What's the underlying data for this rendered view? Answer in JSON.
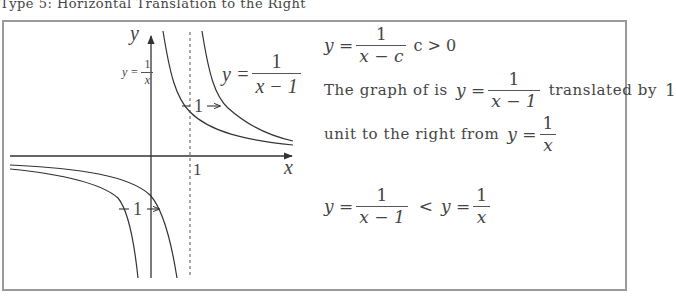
{
  "caption": "Type 5: Horizontal Translation to the Right",
  "graph": {
    "axis_x_label": "x",
    "axis_y_label": "y",
    "tick_label_1": "1",
    "curve_label_left": {
      "lhs": "y =",
      "num": "1",
      "den": "x"
    },
    "curve_label_right": {
      "lhs": "y =",
      "num": "1",
      "den": "x − 1"
    },
    "shift_label_top": "1",
    "shift_label_bottom": "1",
    "colors": {
      "curve": "#333333",
      "axis": "#333333",
      "asymptote": "#555555",
      "frame": "#9a9a9a"
    }
  },
  "explanation": {
    "general_form": {
      "lhs": "y =",
      "num": "1",
      "den": "x − c",
      "condition": "c > 0"
    },
    "line1_prefix": "The graph of is",
    "line1_formula": {
      "lhs": "y =",
      "num": "1",
      "den": "x − 1"
    },
    "line1_suffix": "translated by",
    "line1_amount": "1",
    "line2_prefix": "unit to the right from",
    "line2_formula": {
      "lhs": "y =",
      "num": "1",
      "den": "x"
    },
    "comparison": {
      "left": {
        "lhs": "y =",
        "num": "1",
        "den": "x − 1"
      },
      "operator": "<",
      "right": {
        "lhs": "y =",
        "num": "1",
        "den": "x"
      }
    }
  }
}
